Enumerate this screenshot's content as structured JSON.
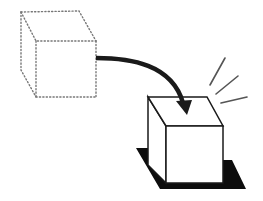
{
  "figure": {
    "description": "Illustration of a dotted (ghost) cube moving along a curved arrow to become a solid cube placed on a dark shadow, with emphasis rays",
    "elements": {
      "source_cube": {
        "style": "dotted",
        "label": ""
      },
      "arrow": {
        "style": "curved-solid",
        "label": ""
      },
      "target_cube": {
        "style": "solid",
        "label": ""
      },
      "shadow": {
        "style": "filled-black",
        "label": ""
      },
      "rays": {
        "count": 3,
        "label": ""
      }
    },
    "colors": {
      "background": "#ffffff",
      "stroke": "#111111",
      "dotted_stroke": "#777777",
      "shadow": "#0d0d0d",
      "rays": "#555555"
    }
  }
}
